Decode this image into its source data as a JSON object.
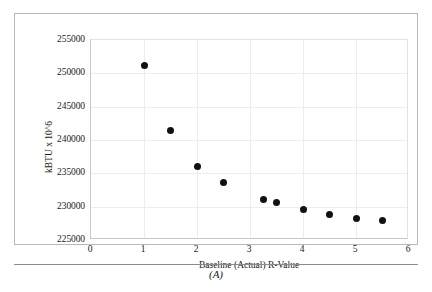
{
  "figure": {
    "caption": "(A)"
  },
  "chart_data": {
    "type": "scatter",
    "title": "",
    "xlabel": "Baseline (Actual) R-Value",
    "ylabel": "kBTU x 10^6",
    "xlim": [
      0,
      6
    ],
    "ylim": [
      225000,
      255000
    ],
    "xticks": [
      "0",
      "1",
      "2",
      "3",
      "4",
      "5",
      "6"
    ],
    "xtick_values": [
      0,
      1,
      2,
      3,
      4,
      5,
      6
    ],
    "yticks": [
      "225000",
      "230000",
      "235000",
      "240000",
      "245000",
      "250000",
      "255000"
    ],
    "ytick_values": [
      225000,
      230000,
      235000,
      240000,
      245000,
      250000,
      255000
    ],
    "grid": true,
    "legend": "none",
    "marker": {
      "shape": "circle",
      "color": "#111111",
      "size": 7
    },
    "series": [
      {
        "name": "Energy use vs R-Value",
        "x": [
          1.0,
          1.5,
          2.0,
          2.5,
          3.25,
          3.5,
          4.0,
          4.5,
          5.0,
          5.5
        ],
        "y": [
          251200,
          241500,
          236100,
          233700,
          231100,
          230700,
          229600,
          228800,
          228300,
          227900
        ]
      }
    ]
  }
}
